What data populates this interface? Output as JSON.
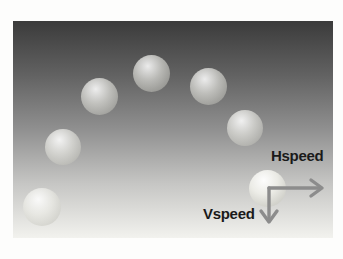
{
  "figure": {
    "title_semantic": "projectile-motion-trajectory",
    "labels": {
      "hspeed": "Hspeed",
      "vspeed": "Vspeed"
    },
    "colors": {
      "background_top": "#3b3b3b",
      "background_bottom": "#f2f2ee",
      "frame": "#ffffff",
      "arrow": "#8c8c8c",
      "label_text": "#1a1a1a",
      "ball_highlight": "#ffffff",
      "ball_shadow": "#a6a69e"
    },
    "balls": [
      {
        "cx": 29,
        "cy": 186,
        "r": 19,
        "strong": false
      },
      {
        "cx": 50,
        "cy": 126,
        "r": 18,
        "strong": false
      },
      {
        "cx": 86,
        "cy": 75,
        "r": 18.5,
        "strong": false
      },
      {
        "cx": 138,
        "cy": 52,
        "r": 18.5,
        "strong": false
      },
      {
        "cx": 195,
        "cy": 65,
        "r": 18.5,
        "strong": false
      },
      {
        "cx": 232,
        "cy": 107,
        "r": 18,
        "strong": false
      },
      {
        "cx": 254,
        "cy": 167,
        "r": 18.5,
        "strong": true
      }
    ],
    "arrows": {
      "corner": {
        "x": 256,
        "y": 167
      },
      "hspeed_tip": {
        "x": 312,
        "y": 167
      },
      "vspeed_tip": {
        "x": 256,
        "y": 203
      }
    }
  }
}
